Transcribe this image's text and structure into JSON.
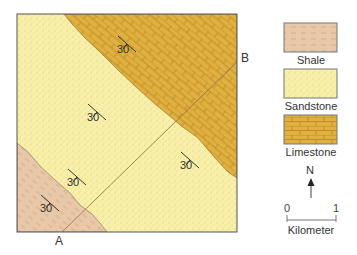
{
  "map": {
    "colors": {
      "shale": "#e8c8a8",
      "sandstone": "#f8f0a8",
      "limestone": "#e0b040",
      "border": "#555555"
    },
    "strike_dip_symbols": [
      {
        "x": 127,
        "y": 44,
        "value": "30"
      },
      {
        "x": 97,
        "y": 112,
        "value": "30"
      },
      {
        "x": 77,
        "y": 177,
        "value": "30"
      },
      {
        "x": 50,
        "y": 203,
        "value": "30"
      },
      {
        "x": 190,
        "y": 160,
        "value": "30"
      }
    ],
    "section_line": {
      "start_label": "A",
      "end_label": "B"
    }
  },
  "legend": {
    "items": [
      {
        "name": "shale",
        "label": "Shale"
      },
      {
        "name": "sandstone",
        "label": "Sandstone"
      },
      {
        "name": "limestone",
        "label": "Limestone"
      }
    ]
  },
  "north_arrow": {
    "label": "N"
  },
  "scale_bar": {
    "min": "0",
    "max": "1",
    "unit": "Kilometer"
  }
}
